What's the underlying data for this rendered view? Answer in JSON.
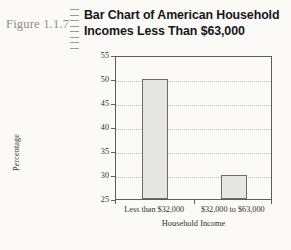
{
  "figure": {
    "label": "Figure 1.1.7",
    "divider_icon": "dashed-vertical-rule-icon"
  },
  "chart_data": {
    "type": "bar",
    "title": "Bar Chart of American Household Incomes Less Than $63,000",
    "title_line1": "Bar Chart of American Household",
    "title_line2": "Incomes Less Than $63,000",
    "categories": [
      "Less than $32,000",
      "$32,000 to $63,000"
    ],
    "values": [
      50,
      30
    ],
    "xlabel": "Household Income",
    "ylabel": "Percentage",
    "ylim": [
      25,
      55
    ],
    "yticks": [
      25,
      30,
      35,
      40,
      45,
      50,
      55
    ],
    "ytick_labels": [
      "25",
      "30",
      "35",
      "40",
      "45",
      "50",
      "55"
    ],
    "grid": "horizontal-dotted",
    "legend": "none",
    "bar_fill_color": "#e6e6e4",
    "bar_border_color": "#6a6a6a",
    "axis_color": "#5d5d5d",
    "gridline_color": "#b9b9b4",
    "background_color": "#fbfaf7",
    "figure_label_color": "#8d8d8d"
  }
}
